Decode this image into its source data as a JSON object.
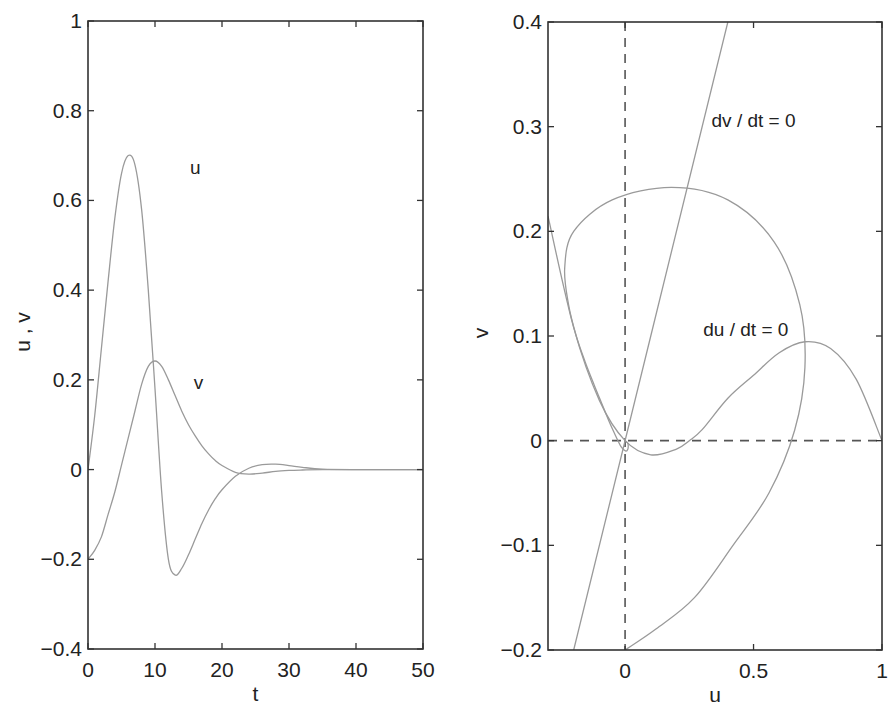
{
  "chart_data": [
    {
      "type": "line",
      "title": "",
      "xlabel": "t",
      "ylabel": "u , v",
      "xlim": [
        0,
        50
      ],
      "ylim": [
        -0.4,
        1
      ],
      "xticks": [
        "0",
        "10",
        "20",
        "30",
        "40",
        "50"
      ],
      "yticks": [
        "-0.4",
        "-0.2",
        "0",
        "0.2",
        "0.4",
        "0.6",
        "0.8",
        "1"
      ],
      "grid": false,
      "legend": null,
      "annotations": [
        {
          "text": "u",
          "x": 16,
          "y": 0.66
        },
        {
          "text": "v",
          "x": 16.5,
          "y": 0.18
        }
      ],
      "series": [
        {
          "name": "u",
          "x": [
            0,
            1,
            2,
            3,
            4,
            5,
            6,
            7,
            8,
            9,
            10,
            11,
            12,
            13,
            14,
            15,
            16,
            17,
            18,
            19,
            20,
            22,
            24,
            26,
            28,
            30,
            32,
            35,
            40,
            50
          ],
          "y": [
            0,
            0.12,
            0.27,
            0.42,
            0.56,
            0.66,
            0.7,
            0.68,
            0.58,
            0.4,
            0.18,
            -0.05,
            -0.2,
            -0.235,
            -0.22,
            -0.19,
            -0.155,
            -0.12,
            -0.09,
            -0.065,
            -0.045,
            -0.015,
            0.003,
            0.011,
            0.012,
            0.009,
            0.005,
            0.001,
            0,
            0
          ]
        },
        {
          "name": "v",
          "x": [
            0,
            1,
            2,
            3,
            4,
            5,
            6,
            7,
            8,
            9,
            10,
            11,
            12,
            13,
            14,
            15,
            16,
            17,
            18,
            19,
            20,
            22,
            24,
            26,
            28,
            30,
            32,
            35,
            40,
            50
          ],
          "y": [
            -0.2,
            -0.18,
            -0.15,
            -0.1,
            -0.05,
            0.01,
            0.07,
            0.13,
            0.19,
            0.23,
            0.242,
            0.23,
            0.2,
            0.165,
            0.13,
            0.1,
            0.075,
            0.053,
            0.035,
            0.02,
            0.009,
            -0.006,
            -0.01,
            -0.008,
            -0.004,
            -0.002,
            -0.001,
            0,
            0,
            0
          ]
        }
      ]
    },
    {
      "type": "line",
      "title": "",
      "xlabel": "u",
      "ylabel": "v",
      "xlim": [
        -0.3,
        1
      ],
      "ylim": [
        -0.2,
        0.4
      ],
      "xticks": [
        "0",
        "0.5",
        "1"
      ],
      "yticks": [
        "-0.2",
        "-0.1",
        "0",
        "0.1",
        "0.2",
        "0.3",
        "0.4"
      ],
      "grid": false,
      "legend": null,
      "annotations": [
        {
          "text": "dv / dt = 0",
          "x": 0.5,
          "y": 0.3
        },
        {
          "text": "du / dt = 0",
          "x": 0.47,
          "y": 0.1
        }
      ],
      "reference_lines": [
        {
          "name": "u = 0",
          "orientation": "vertical",
          "value": 0,
          "style": "dashed"
        },
        {
          "name": "v = 0",
          "orientation": "horizontal",
          "value": 0,
          "style": "dashed"
        }
      ],
      "series": [
        {
          "name": "trajectory",
          "x": [
            0,
            0.12,
            0.27,
            0.42,
            0.56,
            0.66,
            0.7,
            0.68,
            0.58,
            0.4,
            0.18,
            -0.05,
            -0.2,
            -0.235,
            -0.22,
            -0.19,
            -0.155,
            -0.12,
            -0.09,
            -0.065,
            -0.045,
            -0.015,
            0.003,
            0.011,
            0.012,
            0.009,
            0.005,
            0.001,
            0,
            0
          ],
          "y": [
            -0.2,
            -0.18,
            -0.15,
            -0.1,
            -0.05,
            0.01,
            0.07,
            0.13,
            0.19,
            0.23,
            0.242,
            0.23,
            0.2,
            0.165,
            0.13,
            0.1,
            0.075,
            0.053,
            0.035,
            0.02,
            0.009,
            -0.006,
            -0.01,
            -0.008,
            -0.004,
            -0.002,
            -0.001,
            0,
            0,
            0
          ]
        },
        {
          "name": "du/dt = 0 (v = u(u-0.25)(1-u))",
          "x": [
            -0.3,
            -0.2,
            -0.1,
            0,
            0.1,
            0.2,
            0.25,
            0.3,
            0.4,
            0.5,
            0.6,
            0.7,
            0.8,
            0.9,
            1.0
          ],
          "y": [
            0.2145,
            0.108,
            0.0385,
            0,
            -0.0135,
            -0.008,
            0,
            0.0105,
            0.0405,
            0.0625,
            0.084,
            0.0945,
            0.088,
            0.0585,
            0
          ]
        },
        {
          "name": "dv/dt = 0 (v = u)",
          "x": [
            -0.2,
            0.4
          ],
          "y": [
            -0.2,
            0.4
          ]
        }
      ]
    }
  ],
  "style": {
    "curve_color": "#9a9a9a",
    "axis_color": "#333333",
    "text_color": "#222222"
  }
}
